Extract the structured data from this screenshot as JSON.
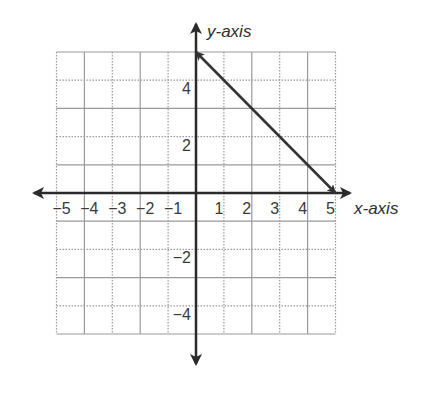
{
  "chart_data": {
    "type": "line",
    "title": "",
    "xlabel": "x-axis",
    "ylabel": "y-axis",
    "xlim": [
      -5,
      5
    ],
    "ylim": [
      -5,
      5
    ],
    "grid": true,
    "x_ticks": [
      -5,
      -4,
      -3,
      -2,
      -1,
      1,
      2,
      3,
      4,
      5
    ],
    "x_tick_labels": [
      "−5",
      "−4",
      "−3",
      "−2",
      "−1",
      "1",
      "2",
      "3",
      "4",
      "5"
    ],
    "y_ticks": [
      4,
      2,
      -2,
      -4
    ],
    "y_tick_labels": [
      "4",
      "2",
      "−2",
      "−4"
    ],
    "series": [
      {
        "name": "line",
        "x": [
          0,
          5
        ],
        "y": [
          5,
          0
        ],
        "arrows": "both-ends"
      }
    ],
    "legend": null
  },
  "colors": {
    "axis": "#2a2a2a",
    "grid": "#9a9a9a",
    "line": "#333333",
    "text": "#3a3a3a"
  }
}
